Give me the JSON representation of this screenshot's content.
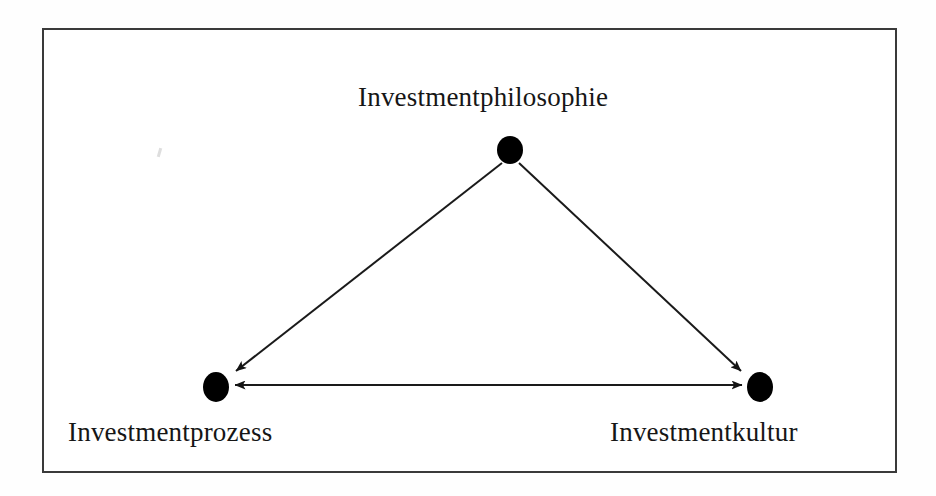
{
  "figure": {
    "type": "triangle-relationship-diagram",
    "background_color": "#ffffff",
    "frame": {
      "border_color": "#3a3a3a",
      "border_width_px": 2,
      "x": 42,
      "y": 28,
      "width": 855,
      "height": 445
    }
  },
  "nodes": [
    {
      "id": "investmentphilosophie",
      "label": "Investmentphilosophie",
      "position": "top",
      "cx": 510,
      "cy": 150,
      "rx": 13,
      "ry": 14,
      "color": "#000000",
      "label_x": 518,
      "label_y": 97
    },
    {
      "id": "investmentprozess",
      "label": "Investmentprozess",
      "position": "bottom-left",
      "cx": 216,
      "cy": 387,
      "rx": 13,
      "ry": 15,
      "color": "#000000",
      "label_x": 200,
      "label_y": 432
    },
    {
      "id": "investmentkultur",
      "label": "Investmentkultur",
      "position": "bottom-right",
      "cx": 760,
      "cy": 387,
      "rx": 13,
      "ry": 15,
      "color": "#000000",
      "label_x": 726,
      "label_y": 432
    }
  ],
  "edges": [
    {
      "id": "philosophie-to-prozess",
      "from": "investmentphilosophie",
      "to": "investmentprozess",
      "direction": "one-way",
      "arrowheads": "end",
      "line_color": "#1a1a1a",
      "line_width_px": 2
    },
    {
      "id": "philosophie-to-kultur",
      "from": "investmentphilosophie",
      "to": "investmentkultur",
      "direction": "one-way",
      "arrowheads": "end",
      "line_color": "#1a1a1a",
      "line_width_px": 2
    },
    {
      "id": "prozess-kultur",
      "from": "investmentprozess",
      "to": "investmentkultur",
      "direction": "bidirectional",
      "arrowheads": "both",
      "line_color": "#1a1a1a",
      "line_width_px": 2
    }
  ],
  "artifacts": [
    {
      "id": "scan-speck",
      "x": 158,
      "y": 148,
      "color": "#d8d8d8"
    }
  ]
}
